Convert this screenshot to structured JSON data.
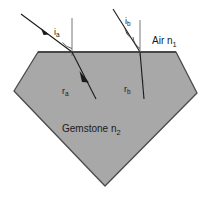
{
  "figure": {
    "background_color": "#ffffff"
  },
  "gemstone": {
    "fill_color": "#a8a8a8",
    "stroke_color": "#4a4a4a",
    "label": "Gemstone n",
    "index_subscript": "2"
  },
  "air": {
    "label": "Air n",
    "index_subscript": "1"
  },
  "rays": [
    {
      "id": "a",
      "incident_label": "i",
      "incident_subscript": "a",
      "refracted_label": "r",
      "refracted_subscript": "a"
    },
    {
      "id": "b",
      "incident_label": "i",
      "incident_subscript": "b",
      "refracted_label": "r",
      "refracted_subscript": "b"
    }
  ],
  "colors": {
    "ray": "#1a1a1a",
    "normal": "#5a5a5a",
    "surface": "#3d3d3d"
  }
}
